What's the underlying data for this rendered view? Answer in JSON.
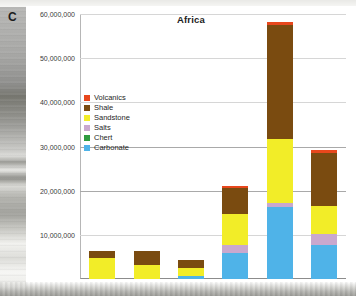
{
  "panel": {
    "letter": "C"
  },
  "chart_data": {
    "type": "bar",
    "stacked": true,
    "title": "Africa",
    "xlabel": "",
    "ylabel": "",
    "ylim": [
      0,
      60000000
    ],
    "ytick_step": 10000000,
    "ytick_labels": [
      "60,000,000",
      "50,000,000",
      "40,000,000",
      "30,000,000",
      "20,000,000",
      "10,000,000"
    ],
    "ytick_values": [
      60000000,
      50000000,
      40000000,
      30000000,
      20000000,
      10000000
    ],
    "grid": true,
    "legend_position": "inside-upper-left",
    "categories": [
      "Sauk",
      "Tippecanoe",
      "Kaskaskia",
      "Absaroka",
      "Zuni",
      "Tejas"
    ],
    "series": [
      {
        "name": "Carbonate",
        "color": "#4FB3E8",
        "values": [
          0,
          0,
          700000,
          6000000,
          16200000,
          7800000
        ]
      },
      {
        "name": "Chert",
        "color": "#2E9B3F",
        "values": [
          0,
          0,
          0,
          0,
          0,
          0
        ]
      },
      {
        "name": "Salts",
        "color": "#C9A8CE",
        "values": [
          0,
          0,
          0,
          1700000,
          1100000,
          2400000
        ]
      },
      {
        "name": "Sandstone",
        "color": "#F2ED28",
        "values": [
          4700000,
          3100000,
          1700000,
          7000000,
          14500000,
          6400000
        ]
      },
      {
        "name": "Shale",
        "color": "#7A4B10",
        "values": [
          1700000,
          3300000,
          2000000,
          5900000,
          25800000,
          11900000
        ]
      },
      {
        "name": "Volcanics",
        "color": "#E8471C",
        "values": [
          0,
          0,
          0,
          400000,
          600000,
          700000
        ]
      }
    ],
    "totals": [
      6400000,
      6400000,
      4400000,
      21000000,
      58200000,
      29200000
    ]
  },
  "legend": {
    "items": [
      {
        "label": "Volcanics",
        "color": "#E8471C"
      },
      {
        "label": "Shale",
        "color": "#7A4B10"
      },
      {
        "label": "Sandstone",
        "color": "#F2ED28"
      },
      {
        "label": "Salts",
        "color": "#C9A8CE"
      },
      {
        "label": "Chert",
        "color": "#2E9B3F"
      },
      {
        "label": "Carbonate",
        "color": "#4FB3E8"
      }
    ]
  }
}
